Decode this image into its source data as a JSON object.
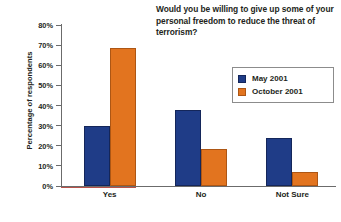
{
  "chart_data": {
    "type": "bar",
    "title": "Would you be willing to give up some of your personal freedom to reduce the threat of terrorism?",
    "xlabel": "",
    "ylabel": "Percentage of respondents",
    "categories": [
      "Yes",
      "No",
      "Not Sure"
    ],
    "series": [
      {
        "name": "May 2001",
        "color": "#1f3c87",
        "values": [
          30,
          38,
          24
        ]
      },
      {
        "name": "October 2001",
        "color": "#e2741f",
        "values": [
          68.5,
          18.5,
          7
        ]
      }
    ],
    "ylim": [
      0,
      80
    ],
    "ytick_labels": [
      "80%",
      "70%",
      "60%",
      "50%",
      "40%",
      "30%",
      "20%",
      "10%",
      "0%"
    ],
    "ytick_values": [
      80,
      70,
      60,
      50,
      40,
      30,
      20,
      10,
      0
    ],
    "grid": false,
    "legend_position": "upper right"
  }
}
